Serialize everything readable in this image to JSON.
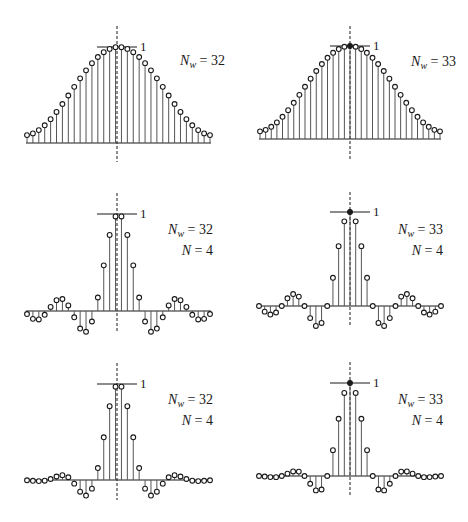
{
  "chart_data": [
    {
      "type": "stem",
      "title": "Hamming window, even length",
      "panel": "top-left",
      "label_lines": [
        "N_w = 32"
      ],
      "params": {
        "Nw": 32
      },
      "peak_label": "1",
      "n": [
        -15.5,
        -14.5,
        -13.5,
        -12.5,
        -11.5,
        -10.5,
        -9.5,
        -8.5,
        -7.5,
        -6.5,
        -5.5,
        -4.5,
        -3.5,
        -2.5,
        -1.5,
        -0.5,
        0.5,
        1.5,
        2.5,
        3.5,
        4.5,
        5.5,
        6.5,
        7.5,
        8.5,
        9.5,
        10.5,
        11.5,
        12.5,
        13.5,
        14.5,
        15.5
      ],
      "values": [
        0.0822,
        0.0998,
        0.1343,
        0.1844,
        0.2482,
        0.3232,
        0.4065,
        0.4949,
        0.5851,
        0.6735,
        0.7568,
        0.8318,
        0.8956,
        0.9457,
        0.9802,
        0.9978,
        0.9978,
        0.9802,
        0.9457,
        0.8956,
        0.8318,
        0.7568,
        0.6735,
        0.5851,
        0.4949,
        0.4065,
        0.3232,
        0.2482,
        0.1844,
        0.1343,
        0.0998,
        0.0822
      ],
      "geom": {
        "x0": 27,
        "x1": 210,
        "cx": 117,
        "base": 143,
        "top": 47,
        "dash_top": 26,
        "dash_bottom": 162,
        "label_x": 225,
        "label_y": 65
      }
    },
    {
      "type": "stem",
      "title": "Hamming window, odd length",
      "panel": "top-right",
      "label_lines": [
        "N_w = 33"
      ],
      "params": {
        "Nw": 33
      },
      "peak_label": "1",
      "n": [
        -16,
        -15,
        -14,
        -13,
        -12,
        -11,
        -10,
        -9,
        -8,
        -7,
        -6,
        -5,
        -4,
        -3,
        -2,
        -1,
        0,
        1,
        2,
        3,
        4,
        5,
        6,
        7,
        8,
        9,
        10,
        11,
        12,
        13,
        14,
        15,
        16
      ],
      "values": [
        0.0821,
        0.0986,
        0.1312,
        0.1784,
        0.2387,
        0.31,
        0.3895,
        0.4745,
        0.5619,
        0.6485,
        0.7311,
        0.8065,
        0.8729,
        0.927,
        0.9671,
        0.9917,
        1.0,
        0.9917,
        0.9671,
        0.927,
        0.8729,
        0.8065,
        0.7311,
        0.6485,
        0.5619,
        0.4745,
        0.3895,
        0.31,
        0.2387,
        0.1784,
        0.1312,
        0.0986,
        0.0821
      ],
      "geom": {
        "x0": 260,
        "x1": 440,
        "cx": 350,
        "base": 139,
        "top": 46,
        "dash_top": 26,
        "dash_bottom": 160,
        "label_x": 456,
        "label_y": 66
      }
    },
    {
      "type": "stem",
      "title": "Truncated sinc, even length",
      "panel": "middle-left",
      "label_lines": [
        "N_w = 32",
        "N = 4"
      ],
      "params": {
        "Nw": 32,
        "N": 4
      },
      "peak_label": "1",
      "n": [
        -15.5,
        -14.5,
        -13.5,
        -12.5,
        -11.5,
        -10.5,
        -9.5,
        -8.5,
        -7.5,
        -6.5,
        -5.5,
        -4.5,
        -3.5,
        -2.5,
        -1.5,
        -0.5,
        0.5,
        1.5,
        2.5,
        3.5,
        4.5,
        5.5,
        6.5,
        7.5,
        8.5,
        9.5,
        10.5,
        11.5,
        12.5,
        13.5,
        14.5,
        15.5
      ],
      "values": [
        -0.0314,
        -0.0811,
        -0.0871,
        -0.039,
        0.0424,
        0.112,
        0.1238,
        0.0573,
        -0.065,
        -0.181,
        -0.2139,
        -0.1083,
        0.1392,
        0.4705,
        0.7842,
        0.9745,
        0.9745,
        0.7842,
        0.4705,
        0.1392,
        -0.1083,
        -0.2139,
        -0.181,
        -0.065,
        0.0573,
        0.1238,
        0.112,
        0.0424,
        -0.039,
        -0.0871,
        -0.0811,
        -0.0314
      ],
      "geom": {
        "x0": 27,
        "x1": 210,
        "cx": 117,
        "base": 311,
        "top": 214,
        "dash_top": 193,
        "dash_bottom": 332,
        "label_x": 213,
        "label_y": 234
      }
    },
    {
      "type": "stem",
      "title": "Truncated sinc, odd length",
      "panel": "middle-right",
      "label_lines": [
        "N_w = 33",
        "N = 4"
      ],
      "params": {
        "Nw": 33,
        "N": 4
      },
      "peak_label": "1",
      "n": [
        -16,
        -15,
        -14,
        -13,
        -12,
        -11,
        -10,
        -9,
        -8,
        -7,
        -6,
        -5,
        -4,
        -3,
        -2,
        -1,
        0,
        1,
        2,
        3,
        4,
        5,
        6,
        7,
        8,
        9,
        10,
        11,
        12,
        13,
        14,
        15,
        16
      ],
      "values": [
        0,
        -0.06,
        -0.0909,
        -0.0693,
        0,
        0.0818,
        0.1273,
        0.1,
        0,
        -0.1286,
        -0.2122,
        -0.1801,
        0,
        0.3001,
        0.6366,
        0.9003,
        1.0,
        0.9003,
        0.6366,
        0.3001,
        0,
        -0.1801,
        -0.2122,
        -0.1286,
        0,
        0.1,
        0.1273,
        0.0818,
        0,
        -0.0693,
        -0.0909,
        -0.06,
        0
      ],
      "geom": {
        "x0": 259,
        "x1": 441,
        "cx": 350,
        "base": 306,
        "top": 212,
        "dash_top": 192,
        "dash_bottom": 327,
        "label_x": 443,
        "label_y": 234
      }
    },
    {
      "type": "stem",
      "title": "Windowed sinc, even length",
      "panel": "bottom-left",
      "label_lines": [
        "N_w = 32",
        "N = 4"
      ],
      "params": {
        "Nw": 32,
        "N": 4
      },
      "peak_label": "1",
      "n": [
        -15.5,
        -14.5,
        -13.5,
        -12.5,
        -11.5,
        -10.5,
        -9.5,
        -8.5,
        -7.5,
        -6.5,
        -5.5,
        -4.5,
        -3.5,
        -2.5,
        -1.5,
        -0.5,
        0.5,
        1.5,
        2.5,
        3.5,
        4.5,
        5.5,
        6.5,
        7.5,
        8.5,
        9.5,
        10.5,
        11.5,
        12.5,
        13.5,
        14.5,
        15.5
      ],
      "values": [
        -0.0026,
        -0.0081,
        -0.0117,
        -0.0072,
        0.0105,
        0.0362,
        0.0503,
        0.0284,
        -0.038,
        -0.1219,
        -0.1619,
        -0.0901,
        0.1247,
        0.445,
        0.7687,
        0.9724,
        0.9724,
        0.7687,
        0.445,
        0.1247,
        -0.0901,
        -0.1619,
        -0.1219,
        -0.038,
        0.0284,
        0.0503,
        0.0362,
        0.0105,
        -0.0072,
        -0.0117,
        -0.0081,
        -0.0026
      ],
      "geom": {
        "x0": 27,
        "x1": 210,
        "cx": 117,
        "base": 480,
        "top": 384,
        "dash_top": 363,
        "dash_bottom": 500,
        "label_x": 213,
        "label_y": 404
      }
    },
    {
      "type": "stem",
      "title": "Windowed sinc, odd length",
      "panel": "bottom-right",
      "label_lines": [
        "N_w = 33",
        "N = 4"
      ],
      "params": {
        "Nw": 33,
        "N": 4
      },
      "peak_label": "1",
      "n": [
        -16,
        -15,
        -14,
        -13,
        -12,
        -11,
        -10,
        -9,
        -8,
        -7,
        -6,
        -5,
        -4,
        -3,
        -2,
        -1,
        0,
        1,
        2,
        3,
        4,
        5,
        6,
        7,
        8,
        9,
        10,
        11,
        12,
        13,
        14,
        15,
        16
      ],
      "values": [
        0,
        -0.0059,
        -0.0119,
        -0.0124,
        0,
        0.0254,
        0.0496,
        0.0475,
        0,
        -0.0834,
        -0.1551,
        -0.1453,
        0,
        0.2782,
        0.6157,
        0.8928,
        1.0,
        0.8928,
        0.6157,
        0.2782,
        0,
        -0.1453,
        -0.1551,
        -0.0834,
        0,
        0.0475,
        0.0496,
        0.0254,
        0,
        -0.0124,
        -0.0119,
        -0.0059,
        0
      ],
      "geom": {
        "x0": 259,
        "x1": 441,
        "cx": 350,
        "base": 476,
        "top": 383,
        "dash_top": 362,
        "dash_bottom": 497,
        "label_x": 443,
        "label_y": 404
      }
    }
  ],
  "style": {
    "ink": "#1a1a1a",
    "stem": "#555555",
    "marker_fill": "#ffffff"
  }
}
